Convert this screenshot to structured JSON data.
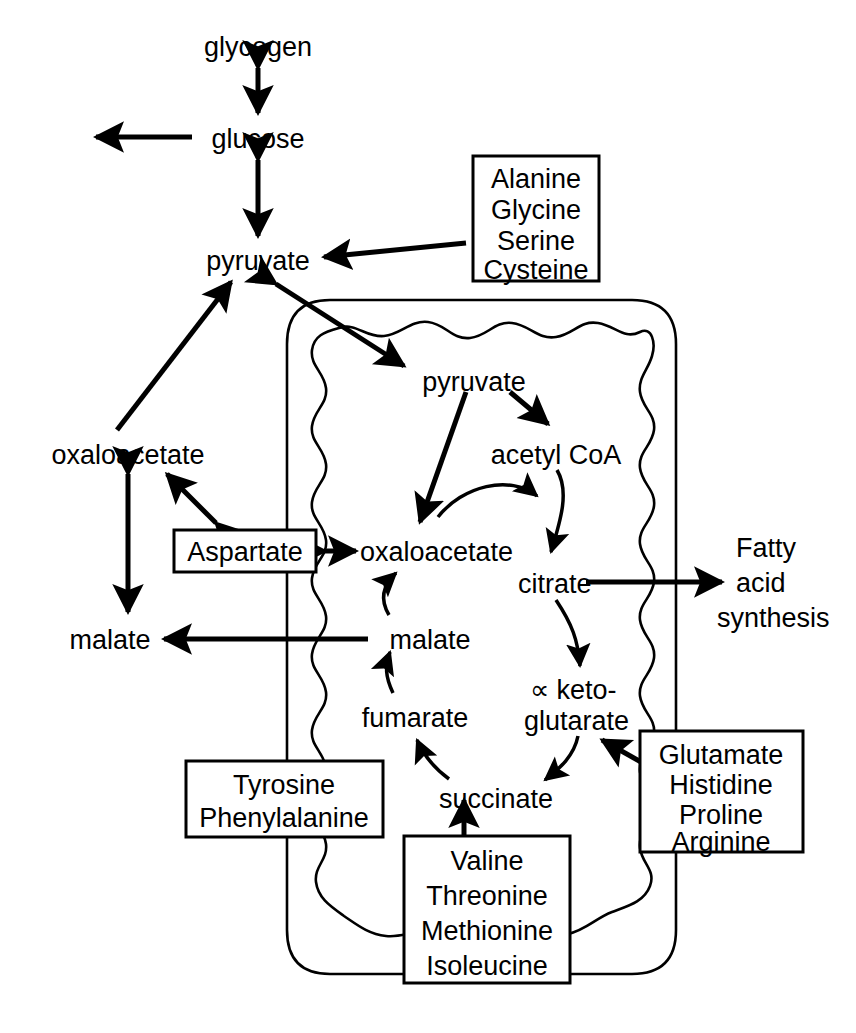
{
  "diagram": {
    "colors": {
      "ink": "#000000",
      "background": "#ffffff"
    },
    "compartments": {
      "mitochondrion": {
        "label": "mitochondrion",
        "outer_membrane": "smooth",
        "inner_membrane": "wavy cristae"
      }
    },
    "metabolites": {
      "glycogen": "glycogen",
      "glucose": "glucose",
      "pyruvate_cytosol": "pyruvate",
      "pyruvate_mito": "pyruvate",
      "acetyl_coa": "acetyl CoA",
      "oxaloacetate_cytosol": "oxaloacetate",
      "oxaloacetate_mito": "oxaloacetate",
      "citrate": "citrate",
      "malate_cytosol": "malate",
      "malate_mito": "malate",
      "fumarate": "fumarate",
      "succinate": "succinate",
      "alpha_ketoglutarate_line1": "∝ keto-",
      "alpha_ketoglutarate_line2": "glutarate"
    },
    "output_labels": {
      "fatty_acid_line1": "Fatty",
      "fatty_acid_line2": "acid",
      "fatty_acid_line3": "synthesis"
    },
    "boxes": [
      {
        "id": "alanine-group",
        "name": "alanine-glycine-serine-cysteine-box",
        "items": [
          "Alanine",
          "Glycine",
          "Serine",
          "Cysteine"
        ],
        "target": "pyruvate"
      },
      {
        "id": "aspartate",
        "name": "aspartate-box",
        "items": [
          "Aspartate"
        ],
        "target": "oxaloacetate"
      },
      {
        "id": "tyrosine-group",
        "name": "tyrosine-phenylalanine-box",
        "items": [
          "Tyrosine",
          "Phenylalanine"
        ],
        "target": "fumarate"
      },
      {
        "id": "valine-group",
        "name": "valine-threonine-methionine-isoleucine-box",
        "items": [
          "Valine",
          "Threonine",
          "Methionine",
          "Isoleucine"
        ],
        "target": "succinate"
      },
      {
        "id": "glutamate-group",
        "name": "glutamate-histidine-proline-arginine-box",
        "items": [
          "Glutamate",
          "Histidine",
          "Proline",
          "Arginine"
        ],
        "target": "alpha-ketoglutarate"
      }
    ],
    "edges": [
      {
        "from": "glycogen",
        "to": "glucose",
        "type": "bidirectional"
      },
      {
        "from": "glucose",
        "to": "export",
        "type": "unidirectional"
      },
      {
        "from": "glucose",
        "to": "pyruvate_cytosol",
        "type": "bidirectional"
      },
      {
        "from": "alanine-group",
        "to": "pyruvate_cytosol",
        "type": "unidirectional"
      },
      {
        "from": "oxaloacetate_cytosol",
        "to": "pyruvate_cytosol",
        "type": "unidirectional"
      },
      {
        "from": "pyruvate_mito",
        "to": "pyruvate_cytosol",
        "type": "bidirectional"
      },
      {
        "from": "pyruvate_mito",
        "to": "acetyl_coa",
        "type": "unidirectional"
      },
      {
        "from": "pyruvate_mito",
        "to": "oxaloacetate_mito",
        "type": "unidirectional"
      },
      {
        "from": "acetyl_coa",
        "to": "citrate",
        "type": "unidirectional"
      },
      {
        "from": "oxaloacetate_mito",
        "to": "citrate",
        "type": "unidirectional"
      },
      {
        "from": "citrate",
        "to": "alpha_ketoglutarate",
        "type": "unidirectional"
      },
      {
        "from": "citrate",
        "to": "fatty_acid_synthesis",
        "type": "unidirectional"
      },
      {
        "from": "alpha_ketoglutarate",
        "to": "succinate",
        "type": "unidirectional"
      },
      {
        "from": "succinate",
        "to": "fumarate",
        "type": "unidirectional"
      },
      {
        "from": "fumarate",
        "to": "malate_mito",
        "type": "unidirectional"
      },
      {
        "from": "malate_mito",
        "to": "oxaloacetate_mito",
        "type": "unidirectional"
      },
      {
        "from": "malate_mito",
        "to": "malate_cytosol",
        "type": "unidirectional"
      },
      {
        "from": "malate_cytosol",
        "to": "oxaloacetate_cytosol",
        "type": "bidirectional"
      },
      {
        "from": "aspartate",
        "to": "oxaloacetate_cytosol",
        "type": "bidirectional"
      },
      {
        "from": "aspartate",
        "to": "oxaloacetate_mito",
        "type": "bidirectional"
      },
      {
        "from": "tyrosine-group",
        "to": "fumarate",
        "type": "unidirectional"
      },
      {
        "from": "valine-group",
        "to": "succinate",
        "type": "unidirectional"
      },
      {
        "from": "glutamate-group",
        "to": "alpha_ketoglutarate",
        "type": "unidirectional"
      }
    ]
  }
}
